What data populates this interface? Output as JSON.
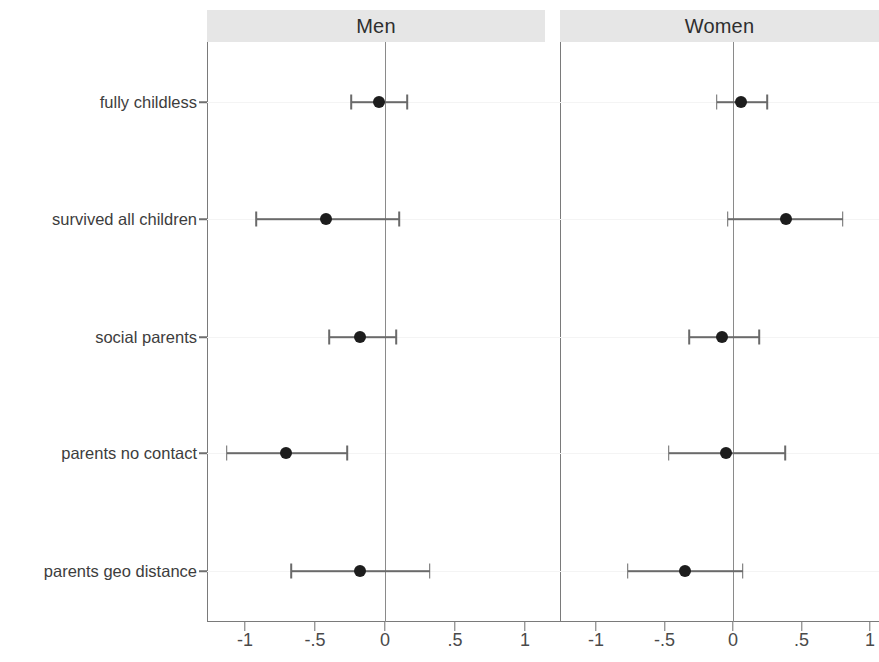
{
  "figure": {
    "background_color": "#ffffff",
    "header_background": "#e6e6e6",
    "point_color": "#1d1d1d",
    "line_color": "#6a6a6a",
    "axis_color": "#7a7a7a"
  },
  "panels": [
    {
      "id": "men",
      "title": "Men"
    },
    {
      "id": "women",
      "title": "Women"
    }
  ],
  "axis": {
    "tick_labels": [
      "-1",
      "-.5",
      "0",
      ".5",
      "1"
    ],
    "tick_values": [
      -1,
      -0.5,
      0,
      0.5,
      1
    ]
  },
  "categories": [
    "fully childless",
    "survived all children",
    "social parents",
    "parents no contact",
    "parents geo distance"
  ],
  "chart_data": {
    "type": "scatter",
    "title": "",
    "subtitle": "",
    "xlabel": "",
    "ylabel": "",
    "grid": false,
    "legend": "none",
    "orientation": "horizontal",
    "plot_style": "forest plot with point estimates and confidence intervals",
    "reference_line": 0,
    "xlim": [
      -1.25,
      1.15
    ],
    "categories": [
      "fully childless",
      "survived all children",
      "social parents",
      "parents no contact",
      "parents geo distance"
    ],
    "xticks": [
      -1,
      -0.5,
      0,
      0.5,
      1
    ],
    "xticklabels": [
      "-1",
      "-.5",
      "0",
      ".5",
      "1"
    ],
    "panels": [
      {
        "name": "Men",
        "points": [
          {
            "category": "fully childless",
            "estimate": -0.04,
            "ci_low": -0.24,
            "ci_high": 0.16
          },
          {
            "category": "survived all children",
            "estimate": -0.42,
            "ci_low": -0.92,
            "ci_high": 0.1
          },
          {
            "category": "social parents",
            "estimate": -0.18,
            "ci_low": -0.4,
            "ci_high": 0.08
          },
          {
            "category": "parents no contact",
            "estimate": -0.71,
            "ci_low": -1.13,
            "ci_high": -0.27
          },
          {
            "category": "parents geo distance",
            "estimate": -0.18,
            "ci_low": -0.67,
            "ci_high": 0.32
          }
        ]
      },
      {
        "name": "Women",
        "points": [
          {
            "category": "fully childless",
            "estimate": 0.06,
            "ci_low": -0.12,
            "ci_high": 0.25
          },
          {
            "category": "survived all children",
            "estimate": 0.39,
            "ci_low": -0.04,
            "ci_high": 0.8
          },
          {
            "category": "social parents",
            "estimate": -0.08,
            "ci_low": -0.32,
            "ci_high": 0.19
          },
          {
            "category": "parents no contact",
            "estimate": -0.05,
            "ci_low": -0.47,
            "ci_high": 0.38
          },
          {
            "category": "parents geo distance",
            "estimate": -0.35,
            "ci_low": -0.77,
            "ci_high": 0.07
          }
        ]
      }
    ]
  }
}
